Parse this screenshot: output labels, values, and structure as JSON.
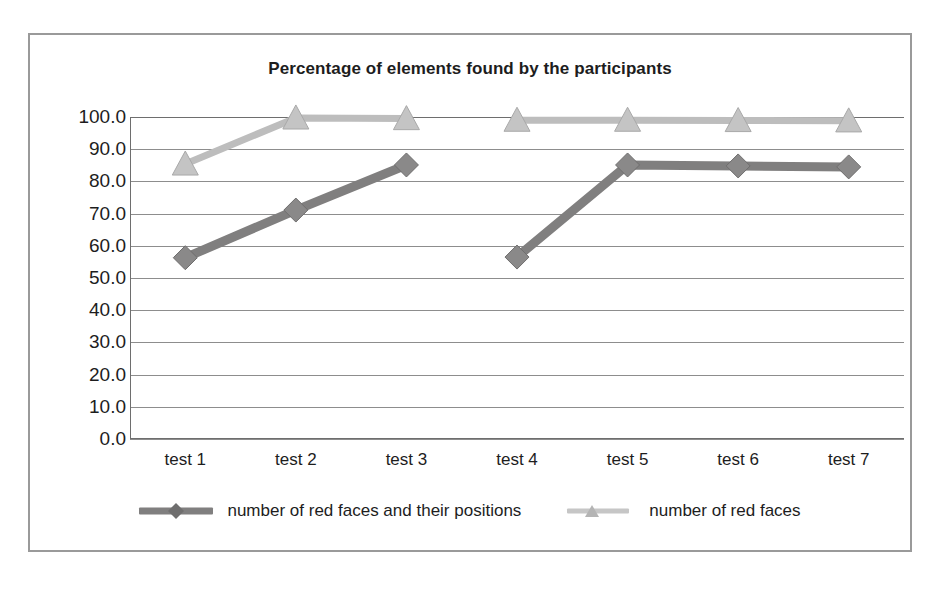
{
  "chart_data": {
    "type": "line",
    "title": "Percentage of elements found by the participants",
    "xlabel": "",
    "ylabel": "",
    "categories": [
      "test 1",
      "test 2",
      "test 3",
      "test 4",
      "test 5",
      "test 6",
      "test 7"
    ],
    "ylim": [
      0,
      100
    ],
    "yticks": [
      "0.0",
      "10.0",
      "20.0",
      "30.0",
      "40.0",
      "50.0",
      "60.0",
      "70.0",
      "80.0",
      "90.0",
      "100.0"
    ],
    "ytick_values": [
      0,
      10,
      20,
      30,
      40,
      50,
      60,
      70,
      80,
      90,
      100
    ],
    "grid": true,
    "legend_position": "bottom",
    "series": [
      {
        "name": "number of red faces and their positions",
        "marker": "diamond",
        "color": "#807f7f",
        "values": [
          56.3,
          71.1,
          85.1,
          56.5,
          85.1,
          84.8,
          84.5
        ],
        "segments": [
          [
            0,
            1,
            2
          ],
          [
            3,
            4,
            5,
            6
          ]
        ]
      },
      {
        "name": "number of red faces",
        "marker": "triangle",
        "color": "#bdbdbd",
        "values": [
          85.4,
          99.7,
          99.5,
          99.0,
          99.0,
          98.9,
          98.8
        ],
        "segments": [
          [
            0,
            1,
            2
          ],
          [
            3,
            4,
            5,
            6
          ]
        ]
      }
    ]
  },
  "colors": {
    "frame": "#9a9a9a",
    "gridline": "#8d8d8d",
    "text": "#1d1d1d",
    "series_dark": "#807f7f",
    "series_light": "#bdbdbd",
    "background": "#ffffff"
  }
}
